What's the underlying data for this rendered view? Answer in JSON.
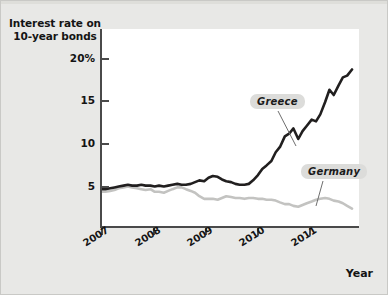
{
  "chart_data": {
    "type": "line",
    "title": "",
    "ylabel": "Interest rate on 10-year bonds",
    "ylabel_line1": "Interest rate on",
    "ylabel_line2": "10-year bonds",
    "xlabel": "Year",
    "ylim": [
      0,
      22.5
    ],
    "xlim": [
      2007.0,
      2011.8
    ],
    "grid": false,
    "legend_position": "inline-callout",
    "y_ticks": [
      {
        "value": 20,
        "label": "20%"
      },
      {
        "value": 15,
        "label": "15"
      },
      {
        "value": 10,
        "label": "10"
      },
      {
        "value": 5,
        "label": "5"
      }
    ],
    "x_ticks": [
      {
        "value": 2007,
        "label": "2007"
      },
      {
        "value": 2008,
        "label": "2008"
      },
      {
        "value": 2009,
        "label": "2009"
      },
      {
        "value": 2010,
        "label": "2010"
      },
      {
        "value": 2011,
        "label": "2011"
      }
    ],
    "series": [
      {
        "name": "Greece",
        "color": "#211f1f",
        "width": 2.6,
        "x": [
          2007.0,
          2007.08,
          2007.17,
          2007.25,
          2007.33,
          2007.42,
          2007.5,
          2007.58,
          2007.67,
          2007.75,
          2007.83,
          2007.92,
          2008.0,
          2008.08,
          2008.17,
          2008.25,
          2008.33,
          2008.42,
          2008.5,
          2008.58,
          2008.67,
          2008.75,
          2008.83,
          2008.92,
          2009.0,
          2009.08,
          2009.17,
          2009.25,
          2009.33,
          2009.42,
          2009.5,
          2009.58,
          2009.67,
          2009.75,
          2009.83,
          2009.92,
          2010.0,
          2010.08,
          2010.17,
          2010.25,
          2010.33,
          2010.42,
          2010.5,
          2010.58,
          2010.67,
          2010.75,
          2010.83,
          2010.92,
          2011.0,
          2011.08,
          2011.17,
          2011.25,
          2011.33,
          2011.42,
          2011.5,
          2011.58,
          2011.67
        ],
        "values": [
          4.3,
          4.3,
          4.4,
          4.5,
          4.6,
          4.7,
          4.8,
          4.7,
          4.7,
          4.8,
          4.7,
          4.7,
          4.6,
          4.7,
          4.6,
          4.7,
          4.8,
          4.9,
          4.8,
          4.8,
          4.9,
          5.1,
          5.3,
          5.2,
          5.6,
          5.8,
          5.7,
          5.4,
          5.2,
          5.1,
          4.9,
          4.8,
          4.8,
          4.9,
          5.3,
          5.9,
          6.6,
          7.0,
          7.5,
          8.5,
          9.1,
          10.3,
          10.6,
          11.2,
          10.0,
          10.9,
          11.5,
          12.2,
          12.0,
          12.8,
          14.2,
          15.6,
          15.0,
          16.1,
          17.0,
          17.2,
          17.9
        ]
      },
      {
        "name": "Germany",
        "color": "#c3c3c1",
        "width": 2.6,
        "x": [
          2007.0,
          2007.08,
          2007.17,
          2007.25,
          2007.33,
          2007.42,
          2007.5,
          2007.58,
          2007.67,
          2007.75,
          2007.83,
          2007.92,
          2008.0,
          2008.08,
          2008.17,
          2008.25,
          2008.33,
          2008.42,
          2008.5,
          2008.58,
          2008.67,
          2008.75,
          2008.83,
          2008.92,
          2009.0,
          2009.08,
          2009.17,
          2009.25,
          2009.33,
          2009.42,
          2009.5,
          2009.58,
          2009.67,
          2009.75,
          2009.83,
          2009.92,
          2010.0,
          2010.08,
          2010.17,
          2010.25,
          2010.33,
          2010.42,
          2010.5,
          2010.58,
          2010.67,
          2010.75,
          2010.83,
          2010.92,
          2011.0,
          2011.08,
          2011.17,
          2011.25,
          2011.33,
          2011.42,
          2011.5,
          2011.58,
          2011.67
        ],
        "values": [
          4.0,
          4.0,
          4.1,
          4.2,
          4.4,
          4.5,
          4.6,
          4.5,
          4.4,
          4.3,
          4.2,
          4.3,
          4.0,
          4.0,
          3.9,
          4.1,
          4.3,
          4.5,
          4.5,
          4.3,
          4.1,
          3.9,
          3.5,
          3.2,
          3.2,
          3.2,
          3.1,
          3.3,
          3.5,
          3.4,
          3.3,
          3.3,
          3.2,
          3.3,
          3.3,
          3.2,
          3.2,
          3.1,
          3.1,
          3.0,
          2.8,
          2.6,
          2.6,
          2.4,
          2.3,
          2.5,
          2.7,
          2.9,
          3.1,
          3.2,
          3.3,
          3.2,
          3.0,
          2.9,
          2.7,
          2.4,
          2.1
        ]
      }
    ],
    "annotations": [
      {
        "text": "Greece",
        "series": "Greece",
        "style": "callout"
      },
      {
        "text": "Germany",
        "series": "Germany",
        "style": "callout"
      }
    ]
  },
  "labels": {
    "y_axis_title_line1": "Interest rate on",
    "y_axis_title_line2": "10-year bonds",
    "x_axis_title": "Year",
    "greece": "Greece",
    "germany": "Germany",
    "y0": "20%",
    "y1": "15",
    "y2": "10",
    "y3": "5",
    "x0": "2007",
    "x1": "2008",
    "x2": "2009",
    "x3": "2010",
    "x4": "2011"
  },
  "colors": {
    "background": "#e8e8e6",
    "plot_background": "#ffffff",
    "axis": "#4a4a4a",
    "text": "#141414",
    "greece_line": "#211f1f",
    "germany_line": "#c3c3c1",
    "callout_background": "#dcdcda"
  }
}
